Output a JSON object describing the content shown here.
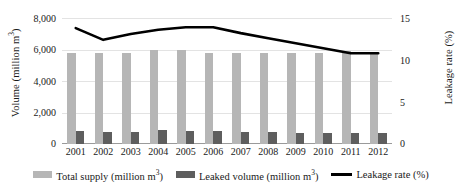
{
  "chart_data": {
    "type": "bar",
    "title": "",
    "categories": [
      "2001",
      "2002",
      "2003",
      "2004",
      "2005",
      "2006",
      "2007",
      "2008",
      "2009",
      "2010",
      "2011",
      "2012"
    ],
    "series": [
      {
        "name": "Total supply (million m³)",
        "type": "bar",
        "axis": "left",
        "color": "#b6b6b6",
        "values": [
          5800,
          5750,
          5780,
          5950,
          5980,
          5760,
          5780,
          5760,
          5770,
          5760,
          5900,
          5810
        ]
      },
      {
        "name": "Leaked volume (million m³)",
        "type": "bar",
        "axis": "left",
        "color": "#5e5e5e",
        "values": [
          800,
          760,
          790,
          860,
          840,
          800,
          760,
          740,
          730,
          720,
          700,
          690
        ]
      },
      {
        "name": "Leakage rate (%)",
        "type": "line",
        "axis": "right",
        "color": "#000000",
        "values": [
          13.8,
          12.4,
          13.1,
          13.6,
          13.9,
          13.9,
          13.2,
          12.6,
          12.0,
          11.4,
          10.8,
          10.8
        ]
      }
    ],
    "xlabel": "",
    "ylabel": "Volume (million m³)",
    "y2label": "Leakage rate (%)",
    "ylim": [
      0,
      8000
    ],
    "yticks": [
      0,
      2000,
      4000,
      6000,
      8000
    ],
    "ytick_labels": [
      "0",
      "2,000",
      "4,000",
      "6,000",
      "8,000"
    ],
    "y2lim": [
      0,
      15
    ],
    "y2ticks": [
      0,
      5,
      10,
      15
    ],
    "y2tick_labels": [
      "0",
      "5",
      "10",
      "15"
    ],
    "grid": true,
    "legend_position": "bottom"
  },
  "legend": {
    "items": [
      {
        "label_main": "Total supply (million m",
        "label_sup": "3",
        "label_tail": ")",
        "marker": "bar-swatch-light",
        "color": "#b6b6b6"
      },
      {
        "label_main": "Leaked volume (million m",
        "label_sup": "3",
        "label_tail": ")",
        "marker": "bar-swatch-dark",
        "color": "#5e5e5e"
      },
      {
        "label_main": "Leakage rate (%)",
        "label_sup": "",
        "label_tail": "",
        "marker": "line-swatch",
        "color": "#000000"
      }
    ]
  },
  "axes": {
    "left_title_main": "Volume (million m",
    "left_title_sup": "3",
    "left_title_tail": ")",
    "right_title": "Leakage rate (%)"
  }
}
